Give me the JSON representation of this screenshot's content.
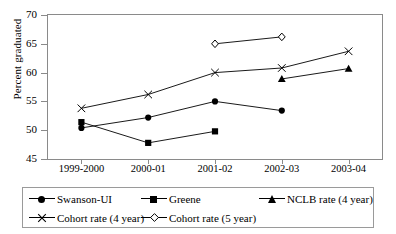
{
  "chart_data": {
    "type": "line",
    "title": "",
    "xlabel": "",
    "ylabel": "Percent graduated",
    "categories": [
      "1999-2000",
      "2000-01",
      "2001-02",
      "2002-03",
      "2003-04"
    ],
    "ylim": [
      45,
      70
    ],
    "yticks": [
      45,
      50,
      55,
      60,
      65,
      70
    ],
    "grid": false,
    "legend_position": "bottom",
    "series": [
      {
        "name": "Swanson-UI",
        "marker": "filled-circle",
        "values": [
          50.4,
          52.2,
          55.0,
          53.4,
          null
        ]
      },
      {
        "name": "Greene",
        "marker": "filled-square",
        "values": [
          51.4,
          47.8,
          49.8,
          null,
          null
        ]
      },
      {
        "name": "NCLB rate (4 year)",
        "marker": "filled-triangle",
        "values": [
          null,
          null,
          null,
          58.9,
          60.7
        ]
      },
      {
        "name": "Cohort rate (4 year)",
        "marker": "cross-x",
        "values": [
          53.8,
          56.2,
          60.0,
          60.8,
          63.7
        ]
      },
      {
        "name": "Cohort rate (5 year)",
        "marker": "open-diamond",
        "values": [
          null,
          null,
          65.0,
          66.2,
          null
        ]
      }
    ]
  },
  "colors": {
    "line": "#000000",
    "axis": "#8a8a8a",
    "background": "#ffffff"
  }
}
